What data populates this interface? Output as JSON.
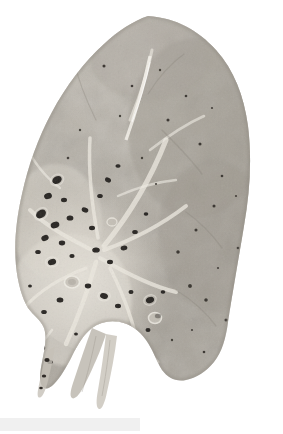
{
  "figure": {
    "title": "Lung gross pathology specimen",
    "modality": "gross pathology photograph",
    "orientation": "apex at top, diaphragmatic surface at bottom right, hilum at center-left",
    "background_color": "#ffffff",
    "specimen_base_color": "#b9b4ab",
    "parenchyma_color": "#aaa59c",
    "pale_septa_color": "#e6e2d9",
    "cavity_color": "#2a2724",
    "shadow_color": "#8d887f"
  },
  "caption": {
    "text": "",
    "strip_color": "#f0f0f0",
    "visible": true
  },
  "annotations": {
    "lesion_count_label": "",
    "scale_bar_label": ""
  },
  "chart_data": {
    "type": "scatter",
    "xlabel": "horizontal position (px)",
    "ylabel": "vertical position (px)",
    "xlim": [
      0,
      283
    ],
    "ylim": [
      0,
      414
    ],
    "grid": false,
    "legend": "none",
    "series": [
      {
        "name": "dilated-bronchial-cavities",
        "color": "#2a2724",
        "points": [
          {
            "x": 57,
            "y": 180,
            "r": 4.2
          },
          {
            "x": 48,
            "y": 196,
            "r": 3.4
          },
          {
            "x": 64,
            "y": 200,
            "r": 2.6
          },
          {
            "x": 41,
            "y": 214,
            "r": 4.6
          },
          {
            "x": 55,
            "y": 225,
            "r": 3.8
          },
          {
            "x": 70,
            "y": 218,
            "r": 3.0
          },
          {
            "x": 45,
            "y": 238,
            "r": 3.2
          },
          {
            "x": 62,
            "y": 243,
            "r": 2.8
          },
          {
            "x": 38,
            "y": 252,
            "r": 2.4
          },
          {
            "x": 52,
            "y": 262,
            "r": 3.6
          },
          {
            "x": 72,
            "y": 256,
            "r": 2.2
          },
          {
            "x": 85,
            "y": 210,
            "r": 3.0
          },
          {
            "x": 92,
            "y": 228,
            "r": 2.6
          },
          {
            "x": 100,
            "y": 196,
            "r": 2.4
          },
          {
            "x": 108,
            "y": 180,
            "r": 2.8
          },
          {
            "x": 118,
            "y": 166,
            "r": 2.2
          },
          {
            "x": 96,
            "y": 250,
            "r": 3.2
          },
          {
            "x": 110,
            "y": 262,
            "r": 2.6
          },
          {
            "x": 124,
            "y": 248,
            "r": 3.0
          },
          {
            "x": 135,
            "y": 232,
            "r": 2.4
          },
          {
            "x": 146,
            "y": 214,
            "r": 2.0
          },
          {
            "x": 88,
            "y": 286,
            "r": 2.8
          },
          {
            "x": 104,
            "y": 296,
            "r": 3.4
          },
          {
            "x": 118,
            "y": 306,
            "r": 2.6
          },
          {
            "x": 131,
            "y": 292,
            "r": 2.2
          },
          {
            "x": 60,
            "y": 300,
            "r": 3.0
          },
          {
            "x": 44,
            "y": 312,
            "r": 2.4
          },
          {
            "x": 34,
            "y": 330,
            "r": 2.6
          },
          {
            "x": 42,
            "y": 348,
            "r": 2.8
          },
          {
            "x": 50,
            "y": 362,
            "r": 2.4
          },
          {
            "x": 150,
            "y": 300,
            "r": 3.6
          },
          {
            "x": 158,
            "y": 316,
            "r": 3.0
          },
          {
            "x": 148,
            "y": 330,
            "r": 2.2
          },
          {
            "x": 163,
            "y": 292,
            "r": 2.0
          },
          {
            "x": 190,
            "y": 286,
            "r": 1.8
          },
          {
            "x": 206,
            "y": 300,
            "r": 1.6
          },
          {
            "x": 178,
            "y": 252,
            "r": 1.6
          },
          {
            "x": 196,
            "y": 230,
            "r": 1.4
          },
          {
            "x": 214,
            "y": 206,
            "r": 1.4
          },
          {
            "x": 168,
            "y": 120,
            "r": 1.4
          },
          {
            "x": 186,
            "y": 96,
            "r": 1.2
          },
          {
            "x": 104,
            "y": 66,
            "r": 1.4
          },
          {
            "x": 132,
            "y": 86,
            "r": 1.2
          },
          {
            "x": 200,
            "y": 144,
            "r": 1.4
          },
          {
            "x": 222,
            "y": 176,
            "r": 1.2
          },
          {
            "x": 238,
            "y": 248,
            "r": 1.2
          },
          {
            "x": 226,
            "y": 320,
            "r": 1.4
          },
          {
            "x": 204,
            "y": 352,
            "r": 1.2
          },
          {
            "x": 76,
            "y": 334,
            "r": 1.6
          },
          {
            "x": 30,
            "y": 286,
            "r": 1.6
          }
        ]
      }
    ]
  }
}
